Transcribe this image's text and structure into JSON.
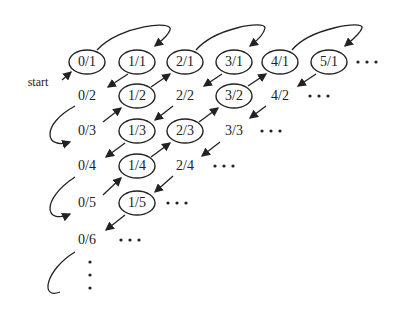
{
  "start_label": "start",
  "ellipsis": "• • •",
  "nodes": [
    {
      "id": "0/1",
      "label": "0/1",
      "x": 87,
      "y": 62,
      "circled": true
    },
    {
      "id": "1/1",
      "label": "1/1",
      "x": 137,
      "y": 62,
      "circled": true
    },
    {
      "id": "2/1",
      "label": "2/1",
      "x": 185,
      "y": 62,
      "circled": true
    },
    {
      "id": "3/1",
      "label": "3/1",
      "x": 234,
      "y": 62,
      "circled": true
    },
    {
      "id": "4/1",
      "label": "4/1",
      "x": 280,
      "y": 62,
      "circled": true
    },
    {
      "id": "5/1",
      "label": "5/1",
      "x": 329,
      "y": 62,
      "circled": true
    },
    {
      "id": "0/2",
      "label": "0/2",
      "x": 87,
      "y": 96,
      "circled": false
    },
    {
      "id": "1/2",
      "label": "1/2",
      "x": 137,
      "y": 96,
      "circled": true
    },
    {
      "id": "2/2",
      "label": "2/2",
      "x": 185,
      "y": 96,
      "circled": false
    },
    {
      "id": "3/2",
      "label": "3/2",
      "x": 234,
      "y": 96,
      "circled": true
    },
    {
      "id": "4/2",
      "label": "4/2",
      "x": 280,
      "y": 96,
      "circled": false
    },
    {
      "id": "0/3",
      "label": "0/3",
      "x": 87,
      "y": 131,
      "circled": false
    },
    {
      "id": "1/3",
      "label": "1/3",
      "x": 137,
      "y": 131,
      "circled": true
    },
    {
      "id": "2/3",
      "label": "2/3",
      "x": 185,
      "y": 131,
      "circled": true
    },
    {
      "id": "3/3",
      "label": "3/3",
      "x": 234,
      "y": 131,
      "circled": false
    },
    {
      "id": "0/4",
      "label": "0/4",
      "x": 87,
      "y": 166,
      "circled": false
    },
    {
      "id": "1/4",
      "label": "1/4",
      "x": 137,
      "y": 166,
      "circled": true
    },
    {
      "id": "2/4",
      "label": "2/4",
      "x": 185,
      "y": 166,
      "circled": false
    },
    {
      "id": "0/5",
      "label": "0/5",
      "x": 87,
      "y": 203,
      "circled": false
    },
    {
      "id": "1/5",
      "label": "1/5",
      "x": 137,
      "y": 203,
      "circled": true
    },
    {
      "id": "0/6",
      "label": "0/6",
      "x": 87,
      "y": 240,
      "circled": false
    }
  ]
}
